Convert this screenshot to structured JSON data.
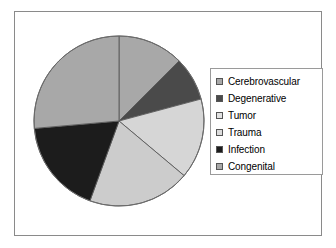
{
  "chart_data": {
    "type": "pie",
    "title": "",
    "subtitle": "",
    "xlabel": "",
    "ylabel": "",
    "grid": false,
    "legend_position": "right",
    "start_angle_deg": 0,
    "direction": "clockwise",
    "categories": [
      "Cerebrovascular",
      "Degenerative",
      "Tumor",
      "Trauma",
      "Infection",
      "Congenital"
    ],
    "values": [
      12.5,
      8.3,
      15.3,
      19.4,
      18.1,
      26.4
    ],
    "units": "percent",
    "slices": [
      {
        "label": "Cerebrovascular",
        "value": 12.5,
        "angle_deg": 45,
        "color": "#a8a8a8"
      },
      {
        "label": "Degenerative",
        "value": 8.3,
        "angle_deg": 30,
        "color": "#4a4a4a"
      },
      {
        "label": "Tumor",
        "value": 15.3,
        "angle_deg": 55,
        "color": "#d6d6d6"
      },
      {
        "label": "Trauma",
        "value": 19.4,
        "angle_deg": 70,
        "color": "#cccccc"
      },
      {
        "label": "Infection",
        "value": 18.1,
        "angle_deg": 65,
        "color": "#1c1c1c"
      },
      {
        "label": "Congenital",
        "value": 26.4,
        "angle_deg": 95,
        "color": "#a8a8a8"
      }
    ]
  },
  "legend": {
    "entries": [
      {
        "label": "Cerebrovascular",
        "color": "#a8a8a8"
      },
      {
        "label": "Degenerative",
        "color": "#4a4a4a"
      },
      {
        "label": "Tumor",
        "color": "#e2e2e2"
      },
      {
        "label": "Trauma",
        "color": "#dcdcdc"
      },
      {
        "label": "Infection",
        "color": "#1c1c1c"
      },
      {
        "label": "Congenital",
        "color": "#a8a8a8"
      }
    ]
  },
  "style": {
    "frame_border": "#8a8a8a",
    "pie_outline": "#6b6b6b",
    "slice_divider": "#5a5a5a",
    "background": "#ffffff",
    "text": "#000000"
  }
}
